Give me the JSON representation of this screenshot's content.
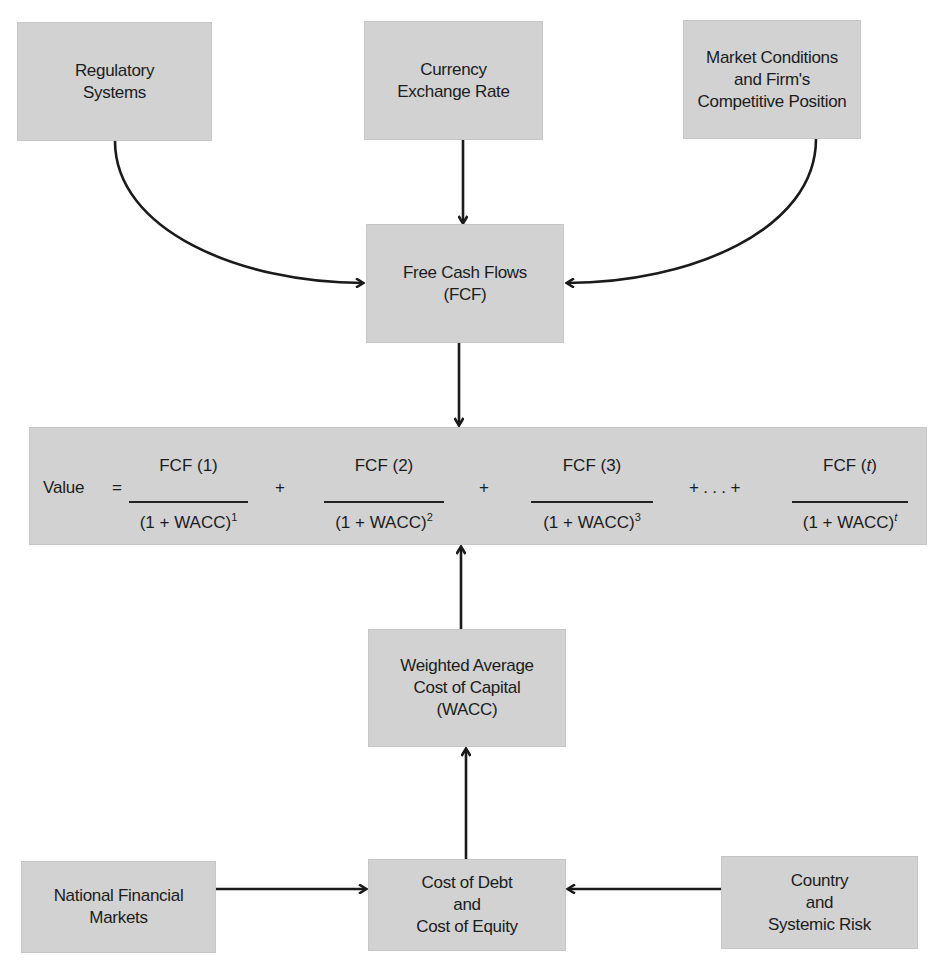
{
  "diagram": {
    "top_inputs": [
      {
        "id": "regulatory",
        "lines": [
          "Regulatory",
          "Systems"
        ]
      },
      {
        "id": "currency",
        "lines": [
          "Currency",
          "Exchange Rate"
        ]
      },
      {
        "id": "market",
        "lines": [
          "Market Conditions",
          "and Firm's",
          "Competitive Position"
        ]
      }
    ],
    "fcf": {
      "lines": [
        "Free Cash Flows",
        "(FCF)"
      ]
    },
    "formula": {
      "label": "Value",
      "equals": "=",
      "terms": [
        {
          "num": "FCF (1)",
          "den_base": "(1 + WACC)",
          "den_exp": "1"
        },
        {
          "num": "FCF (2)",
          "den_base": "(1 + WACC)",
          "den_exp": "2"
        },
        {
          "num": "FCF (3)",
          "den_base": "(1 + WACC)",
          "den_exp": "3"
        },
        {
          "num_prefix": "FCF (",
          "num_var": "t",
          "num_suffix": ")",
          "den_base": "(1 + WACC)",
          "den_exp": "t"
        }
      ],
      "plus": "+",
      "ellipsis": "+ . . . +"
    },
    "wacc": {
      "lines": [
        "Weighted Average",
        "Cost of Capital",
        "(WACC)"
      ]
    },
    "bottom_inputs": [
      {
        "id": "national",
        "lines": [
          "National Financial",
          "Markets"
        ]
      },
      {
        "id": "cost",
        "lines": [
          "Cost of Debt",
          "and",
          "Cost of Equity"
        ]
      },
      {
        "id": "country",
        "lines": [
          "Country",
          "and",
          "Systemic Risk"
        ]
      }
    ],
    "colors": {
      "box_fill": "#d2d2d2",
      "arrow": "#1a1a1a",
      "text": "#1c1c1c"
    }
  }
}
